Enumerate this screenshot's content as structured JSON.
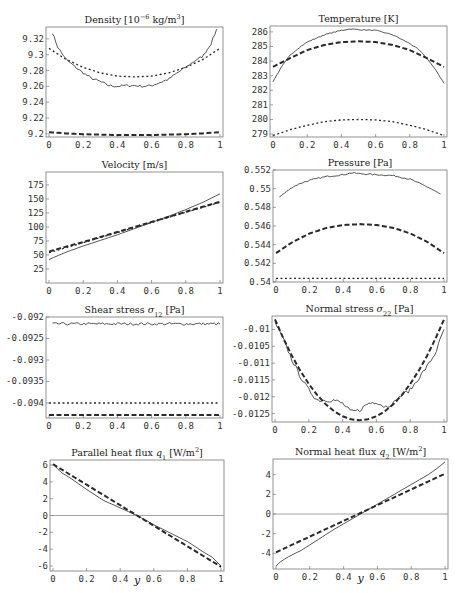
{
  "chart_data": [
    {
      "id": "density",
      "type": "line",
      "title": "Density [10^-6 kg/m^3]",
      "title_parts": {
        "pre": "Density [10",
        "sup": "−6",
        "mid": " kg/m",
        "sup2": "3",
        "post": "]"
      },
      "xlabel": "",
      "ylabel": "",
      "xlim": [
        0,
        1
      ],
      "ylim": [
        9.196,
        9.335
      ],
      "xticks": [
        0,
        0.2,
        0.4,
        0.6,
        0.8,
        1
      ],
      "xtick_labels": [
        "0",
        "0.2",
        "0.4",
        "0.6",
        "0.8",
        "1"
      ],
      "yticks": [
        9.2,
        9.22,
        9.24,
        9.26,
        9.28,
        9.3,
        9.32
      ],
      "ytick_labels": [
        "9.2",
        "9.22",
        "9.24",
        "9.26",
        "9.28",
        "9.3",
        "9.32"
      ],
      "grid": false,
      "frame": {
        "left": 46,
        "top": 27,
        "right": 223,
        "bottom": 137
      },
      "series": [
        {
          "name": "simulation",
          "style": "solid",
          "noise": 0.0015,
          "x": [
            0.02,
            0.05,
            0.1,
            0.15,
            0.2,
            0.25,
            0.3,
            0.35,
            0.4,
            0.45,
            0.5,
            0.55,
            0.6,
            0.65,
            0.7,
            0.75,
            0.8,
            0.85,
            0.9,
            0.95,
            0.98
          ],
          "y": [
            9.328,
            9.31,
            9.294,
            9.285,
            9.277,
            9.27,
            9.266,
            9.261,
            9.26,
            9.261,
            9.261,
            9.26,
            9.261,
            9.265,
            9.269,
            9.277,
            9.284,
            9.292,
            9.298,
            9.315,
            9.332
          ]
        },
        {
          "name": "model-A",
          "style": "dotted",
          "x": [
            0,
            0.1,
            0.2,
            0.3,
            0.4,
            0.5,
            0.6,
            0.7,
            0.8,
            0.9,
            1
          ],
          "y": [
            9.308,
            9.294,
            9.284,
            9.277,
            9.273,
            9.272,
            9.273,
            9.277,
            9.284,
            9.294,
            9.308
          ]
        },
        {
          "name": "model-B",
          "style": "dashed",
          "x": [
            0,
            0.1,
            0.2,
            0.3,
            0.4,
            0.5,
            0.6,
            0.7,
            0.8,
            0.9,
            1
          ],
          "y": [
            9.202,
            9.2005,
            9.1995,
            9.199,
            9.1985,
            9.1985,
            9.1985,
            9.199,
            9.1995,
            9.2005,
            9.202
          ]
        }
      ]
    },
    {
      "id": "temperature",
      "type": "line",
      "title": "Temperature [K]",
      "xlim": [
        0,
        1
      ],
      "ylim": [
        278.8,
        286.4
      ],
      "xticks": [
        0,
        0.2,
        0.4,
        0.6,
        0.8,
        1
      ],
      "xtick_labels": [
        "0",
        "0.2",
        "0.4",
        "0.6",
        "0.8",
        "1"
      ],
      "yticks": [
        279,
        280,
        281,
        282,
        283,
        284,
        285,
        286
      ],
      "ytick_labels": [
        "279",
        "280",
        "281",
        "282",
        "283",
        "284",
        "285",
        "286"
      ],
      "grid": false,
      "frame": {
        "left": 270,
        "top": 26,
        "right": 447,
        "bottom": 137
      },
      "series": [
        {
          "name": "simulation",
          "style": "solid",
          "noise": 0.03,
          "x": [
            0,
            0.05,
            0.1,
            0.15,
            0.2,
            0.3,
            0.4,
            0.45,
            0.5,
            0.6,
            0.7,
            0.8,
            0.85,
            0.9,
            0.95,
            1
          ],
          "y": [
            282.6,
            283.6,
            284.4,
            284.9,
            285.3,
            285.8,
            286.1,
            286.2,
            286.15,
            286.1,
            285.8,
            285.2,
            284.8,
            284.2,
            283.4,
            282.5
          ]
        },
        {
          "name": "model-B",
          "style": "dashed",
          "x": [
            0,
            0.1,
            0.2,
            0.3,
            0.4,
            0.5,
            0.6,
            0.7,
            0.8,
            0.9,
            1
          ],
          "y": [
            283.6,
            284.2,
            284.75,
            285.1,
            285.3,
            285.35,
            285.3,
            285.1,
            284.75,
            284.2,
            283.6
          ]
        },
        {
          "name": "model-A",
          "style": "dotted",
          "x": [
            0,
            0.1,
            0.2,
            0.3,
            0.4,
            0.5,
            0.6,
            0.7,
            0.8,
            0.9,
            1
          ],
          "y": [
            278.9,
            279.3,
            279.6,
            279.85,
            279.97,
            280.0,
            279.97,
            279.85,
            279.6,
            279.3,
            278.9
          ]
        }
      ]
    },
    {
      "id": "velocity",
      "type": "line",
      "title": "Velocity [m/s]",
      "xlim": [
        0,
        1
      ],
      "ylim": [
        0,
        198
      ],
      "xticks": [
        0,
        0.2,
        0.4,
        0.6,
        0.8,
        1
      ],
      "xtick_labels": [
        "0",
        "0.2",
        "0.4",
        "0.6",
        "0.8",
        "1"
      ],
      "yticks": [
        25,
        50,
        75,
        100,
        125,
        150,
        175
      ],
      "ytick_labels": [
        "25",
        "50",
        "75",
        "100",
        "125",
        "150",
        "175"
      ],
      "grid": false,
      "frame": {
        "left": 46,
        "top": 172,
        "right": 223,
        "bottom": 283
      },
      "series": [
        {
          "name": "simulation",
          "style": "solid",
          "x": [
            0,
            0.1,
            0.2,
            0.3,
            0.4,
            0.5,
            0.6,
            0.7,
            0.8,
            0.9,
            1
          ],
          "y": [
            42,
            55,
            66,
            76,
            86,
            97,
            108,
            119,
            131,
            144,
            159
          ]
        },
        {
          "name": "model-B",
          "style": "dashed",
          "x": [
            0,
            0.1,
            0.2,
            0.3,
            0.4,
            0.5,
            0.6,
            0.7,
            0.8,
            0.9,
            1
          ],
          "y": [
            56,
            65,
            73,
            82,
            91,
            100,
            109,
            118,
            127,
            136,
            145
          ]
        },
        {
          "name": "model-A",
          "style": "dotted",
          "x": [
            0,
            0.1,
            0.2,
            0.3,
            0.4,
            0.5,
            0.6,
            0.7,
            0.8,
            0.9,
            1
          ],
          "y": [
            54,
            63,
            72,
            81,
            90,
            99,
            108,
            117,
            126,
            135,
            144
          ]
        }
      ]
    },
    {
      "id": "pressure",
      "type": "line",
      "title": "Pressure [Pa]",
      "xlim": [
        0,
        1
      ],
      "ylim": [
        0.54,
        0.552
      ],
      "xticks": [
        0,
        0.2,
        0.4,
        0.6,
        0.8,
        1
      ],
      "xtick_labels": [
        "0",
        "0.2",
        "0.4",
        "0.6",
        "0.8",
        "1"
      ],
      "yticks": [
        0.54,
        0.542,
        0.544,
        0.546,
        0.548,
        0.55,
        0.552
      ],
      "ytick_labels": [
        "0.54",
        "0.542",
        "0.544",
        "0.546",
        "0.548",
        "0.55",
        "0.552"
      ],
      "grid": false,
      "frame": {
        "left": 273,
        "top": 170,
        "right": 447,
        "bottom": 282
      },
      "series": [
        {
          "name": "simulation",
          "style": "solid",
          "noise": 7e-05,
          "x": [
            0.02,
            0.05,
            0.1,
            0.15,
            0.2,
            0.3,
            0.4,
            0.45,
            0.5,
            0.6,
            0.7,
            0.8,
            0.9,
            0.95,
            0.98
          ],
          "y": [
            0.5491,
            0.5495,
            0.5502,
            0.5506,
            0.5509,
            0.5513,
            0.5515,
            0.5517,
            0.5516,
            0.5515,
            0.5514,
            0.551,
            0.5502,
            0.5497,
            0.5494
          ]
        },
        {
          "name": "model-B",
          "style": "dashed",
          "x": [
            0,
            0.1,
            0.2,
            0.3,
            0.4,
            0.5,
            0.6,
            0.7,
            0.8,
            0.9,
            1
          ],
          "y": [
            0.5431,
            0.5443,
            0.5452,
            0.5458,
            0.5461,
            0.5462,
            0.5461,
            0.5458,
            0.5452,
            0.5443,
            0.5431
          ]
        },
        {
          "name": "model-A",
          "style": "dotted",
          "x": [
            0,
            1
          ],
          "y": [
            0.5404,
            0.5404
          ]
        }
      ]
    },
    {
      "id": "shear-stress",
      "type": "line",
      "title": "Shear stress σ12 [Pa]",
      "title_parts": {
        "pre": "Shear stress ",
        "sym": "σ",
        "sub": "12",
        "post": " [Pa]"
      },
      "xlim": [
        0,
        1
      ],
      "ylim": [
        -0.09435,
        -0.092
      ],
      "xticks": [
        0,
        0.2,
        0.4,
        0.6,
        0.8,
        1
      ],
      "xtick_labels": [
        "0",
        "0.2",
        "0.4",
        "0.6",
        "0.8",
        "1"
      ],
      "yticks": [
        -0.094,
        -0.0935,
        -0.093,
        -0.0925,
        -0.092
      ],
      "ytick_labels": [
        "-0.094",
        "-0.0935",
        "-0.093",
        "-0.0925",
        "-0.092"
      ],
      "grid": false,
      "frame": {
        "left": 46,
        "top": 317,
        "right": 223,
        "bottom": 418
      },
      "series": [
        {
          "name": "simulation",
          "style": "solid",
          "noise": 3e-05,
          "x": [
            0.02,
            1
          ],
          "y": [
            -0.09216,
            -0.09216
          ]
        },
        {
          "name": "model-A",
          "style": "dotted",
          "x": [
            0,
            1
          ],
          "y": [
            -0.094,
            -0.094
          ]
        },
        {
          "name": "model-B",
          "style": "dashed",
          "x": [
            0,
            1
          ],
          "y": [
            -0.09428,
            -0.09428
          ]
        }
      ]
    },
    {
      "id": "normal-stress",
      "type": "line",
      "title": "Normal stress σ22 [Pa]",
      "title_parts": {
        "pre": "Normal stress ",
        "sym": "σ",
        "sub": "22",
        "post": " [Pa]"
      },
      "xlim": [
        0,
        1
      ],
      "ylim": [
        -0.01275,
        -0.0096
      ],
      "xticks": [
        0,
        0.2,
        0.4,
        0.6,
        0.8,
        1
      ],
      "xtick_labels": [
        "0",
        "0.2",
        "0.4",
        "0.6",
        "0.8",
        "1"
      ],
      "yticks": [
        -0.0125,
        -0.012,
        -0.0115,
        -0.011,
        -0.0105,
        -0.01
      ],
      "ytick_labels": [
        "-0.0125",
        "-0.012",
        "-0.0115",
        "-0.011",
        "-0.0105",
        "-0.01"
      ],
      "grid": false,
      "frame": {
        "left": 272,
        "top": 316,
        "right": 447,
        "bottom": 422
      },
      "series": [
        {
          "name": "simulation",
          "style": "solid",
          "noise": 6e-05,
          "x": [
            0,
            0.05,
            0.1,
            0.15,
            0.2,
            0.25,
            0.3,
            0.35,
            0.4,
            0.45,
            0.5,
            0.55,
            0.6,
            0.65,
            0.7,
            0.75,
            0.8,
            0.85,
            0.9,
            0.95,
            1
          ],
          "y": [
            -0.0098,
            -0.0103,
            -0.0109,
            -0.0114,
            -0.0118,
            -0.0121,
            -0.0121,
            -0.0121,
            -0.0122,
            -0.01245,
            -0.0124,
            -0.0122,
            -0.01215,
            -0.0123,
            -0.0122,
            -0.01195,
            -0.0118,
            -0.01145,
            -0.0111,
            -0.0107,
            -0.01
          ]
        },
        {
          "name": "model-B",
          "style": "dashed",
          "x": [
            0,
            0.05,
            0.1,
            0.15,
            0.2,
            0.25,
            0.3,
            0.35,
            0.4,
            0.45,
            0.5,
            0.55,
            0.6,
            0.65,
            0.7,
            0.75,
            0.8,
            0.85,
            0.9,
            0.95,
            1
          ],
          "y": [
            -0.0097,
            -0.01027,
            -0.01078,
            -0.01123,
            -0.01162,
            -0.01195,
            -0.01222,
            -0.01243,
            -0.01258,
            -0.01267,
            -0.0127,
            -0.01267,
            -0.01258,
            -0.01243,
            -0.01222,
            -0.01195,
            -0.01162,
            -0.01123,
            -0.01078,
            -0.01027,
            -0.0097
          ]
        }
      ]
    },
    {
      "id": "parallel-heat-flux",
      "type": "line",
      "title": "Parallel heat flux q1 [W/m^2]",
      "title_parts": {
        "pre": "Parallel heat flux ",
        "sym": "q",
        "sub": "1",
        "mid": " [W/m",
        "sup2": "2",
        "post": "]"
      },
      "xlabel": "y",
      "xlim": [
        0,
        1
      ],
      "ylim": [
        -6.6,
        6.6
      ],
      "xticks": [
        0,
        0.2,
        0.4,
        0.6,
        0.8,
        1
      ],
      "xtick_labels": [
        "0",
        "0.2",
        "0.4",
        "0.6",
        "0.8",
        "1"
      ],
      "yticks": [
        -6,
        -4,
        -2,
        0,
        2,
        4,
        6
      ],
      "ytick_labels": [
        "-6",
        "-4",
        "-2",
        "0",
        "2",
        "4",
        "6"
      ],
      "grid": false,
      "zero_line": true,
      "frame": {
        "left": 50,
        "top": 460,
        "right": 224,
        "bottom": 571
      },
      "series": [
        {
          "name": "simulation",
          "style": "solid",
          "x": [
            0,
            0.05,
            0.1,
            0.2,
            0.3,
            0.4,
            0.5,
            0.6,
            0.7,
            0.8,
            0.9,
            0.95,
            1
          ],
          "y": [
            6.1,
            5.1,
            4.5,
            3.1,
            1.8,
            0.9,
            0.0,
            -1.1,
            -2.1,
            -3.1,
            -4.4,
            -5.0,
            -6.0
          ]
        },
        {
          "name": "model-B",
          "style": "dashed",
          "x": [
            0,
            1
          ],
          "y": [
            6.1,
            -6.1
          ]
        }
      ]
    },
    {
      "id": "normal-heat-flux",
      "type": "line",
      "title": "Normal heat flux q2 [W/m^2]",
      "title_parts": {
        "pre": "Normal heat flux ",
        "sym": "q",
        "sub": "2",
        "mid": " [W/m",
        "sup2": "2",
        "post": "]"
      },
      "xlabel": "y",
      "xlim": [
        0,
        1
      ],
      "ylim": [
        -5.6,
        5.6
      ],
      "xticks": [
        0,
        0.2,
        0.4,
        0.6,
        0.8,
        1
      ],
      "xtick_labels": [
        "0",
        "0.2",
        "0.4",
        "0.6",
        "0.8",
        "1"
      ],
      "yticks": [
        -4,
        -2,
        0,
        2,
        4
      ],
      "ytick_labels": [
        "-4",
        "-2",
        "0",
        "2",
        "4"
      ],
      "grid": false,
      "zero_line": true,
      "frame": {
        "left": 273,
        "top": 459,
        "right": 448,
        "bottom": 569
      },
      "series": [
        {
          "name": "simulation",
          "style": "solid",
          "x": [
            0,
            0.03,
            0.08,
            0.15,
            0.25,
            0.35,
            0.45,
            0.5,
            0.6,
            0.7,
            0.8,
            0.9,
            0.95,
            1
          ],
          "y": [
            -5.3,
            -4.8,
            -4.3,
            -3.7,
            -2.6,
            -1.5,
            -0.5,
            0.0,
            1.0,
            2.0,
            3.0,
            4.0,
            4.6,
            5.3
          ]
        },
        {
          "name": "model-B",
          "style": "dashed",
          "x": [
            0,
            1
          ],
          "y": [
            -3.9,
            4.1
          ]
        }
      ]
    }
  ],
  "styles": {
    "line_color": "#2a2a2a",
    "frame_color": "#777777",
    "zero_line_color": "#8a8a8a"
  }
}
